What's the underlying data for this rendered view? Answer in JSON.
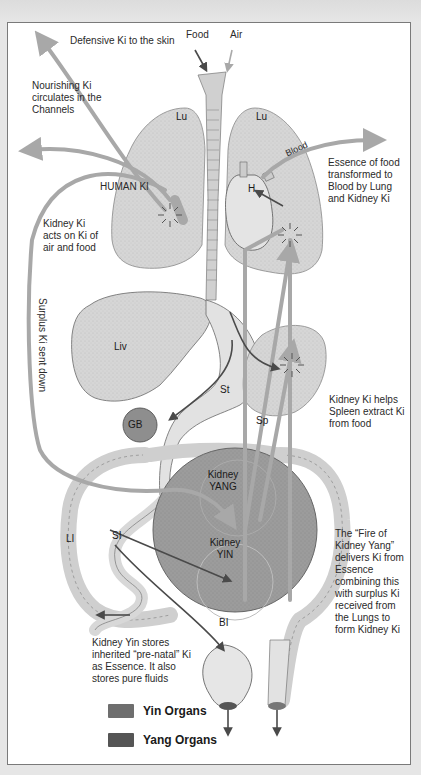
{
  "diagram": {
    "annotations": {
      "defensive_ki": "Defensive Ki to the skin",
      "food": "Food",
      "air": "Air",
      "nourishing_ki": "Nourishing Ki circulates in the Channels",
      "human_ki": "HUMAN KI",
      "blood": "Blood",
      "essence_blood": "Essence of food transformed to Blood by Lung and Kidney Ki",
      "kidney_ki_acts": "Kidney Ki acts on Ki of air and food",
      "surplus_ki": "Surplus Ki sent down",
      "kidney_ki_helps": "Kidney Ki helps Spleen extract Ki from food",
      "fire_kidney_yang": "The “Fire of Kidney Yang” delivers Ki from Essence combining this with surplus Ki received from the Lungs to form Kidney Ki",
      "kidney_yin_stores": "Kidney Yin stores inherited “pre-natal” Ki as Essence. It also stores pure fluids"
    },
    "organs": {
      "lung_left": "Lu",
      "lung_right": "Lu",
      "heart": "H",
      "liver": "Liv",
      "stomach": "St",
      "gall_bladder": "GB",
      "spleen": "Sp",
      "kidney_yang": "Kidney YANG",
      "kidney_yin": "Kidney YIN",
      "large_intestine": "LI",
      "small_intestine": "SI",
      "bladder": "BI"
    },
    "legend": [
      {
        "label": "Yin Organs",
        "color": "#6e6e6e"
      },
      {
        "label": "Yang Organs",
        "color": "#555555"
      }
    ],
    "colors": {
      "ki_arrow": "#a8a8a8",
      "dark_arrow": "#4a4a4a",
      "organ_fill": "#d9d9d9",
      "kidney_fill": "#9a9a9a"
    }
  }
}
